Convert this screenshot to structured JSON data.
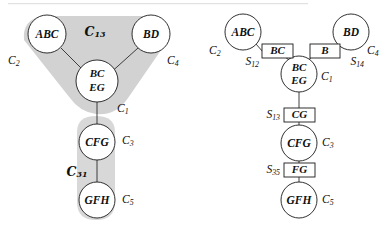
{
  "figure": {
    "caption_top_rule": "",
    "panels": [
      {
        "id": "left",
        "name": "shaded-hypergraph-panel",
        "cluster_labels": [
          {
            "symbol": "C",
            "script": true,
            "sub": "13"
          },
          {
            "symbol": "C",
            "script": true,
            "sub": "31"
          }
        ],
        "nodes": [
          {
            "id": "abc",
            "lines": [
              "ABC"
            ],
            "tag": "C",
            "tag_sub": "2"
          },
          {
            "id": "bd",
            "lines": [
              "BD"
            ],
            "tag": "C",
            "tag_sub": "4"
          },
          {
            "id": "bceg",
            "lines": [
              "BC",
              "EG"
            ],
            "tag": "C",
            "tag_sub": "1"
          },
          {
            "id": "cfg",
            "lines": [
              "CFG"
            ],
            "tag": "C",
            "tag_sub": "3"
          },
          {
            "id": "gfh",
            "lines": [
              "GFH"
            ],
            "tag": "C",
            "tag_sub": "5"
          }
        ]
      },
      {
        "id": "right",
        "name": "junction-tree-panel",
        "nodes": [
          {
            "id": "abc",
            "lines": [
              "ABC"
            ],
            "tag": "C",
            "tag_sub": "2"
          },
          {
            "id": "bd",
            "lines": [
              "BD"
            ],
            "tag": "C",
            "tag_sub": "4"
          },
          {
            "id": "bceg",
            "lines": [
              "BC",
              "EG"
            ],
            "tag": "C",
            "tag_sub": "1"
          },
          {
            "id": "cfg",
            "lines": [
              "CFG"
            ],
            "tag": "C",
            "tag_sub": "3"
          },
          {
            "id": "gfh",
            "lines": [
              "GFH"
            ],
            "tag": "C",
            "tag_sub": "5"
          }
        ],
        "separators": [
          {
            "id": "s12",
            "label": "BC",
            "tag": "S",
            "tag_sub": "12"
          },
          {
            "id": "s14",
            "label": "B",
            "tag": "S",
            "tag_sub": "14"
          },
          {
            "id": "s13",
            "label": "CG",
            "tag": "S",
            "tag_sub": "13"
          },
          {
            "id": "s35",
            "label": "FG",
            "tag": "S",
            "tag_sub": "35"
          }
        ]
      }
    ]
  },
  "left_panel": {
    "script_c13_symbol": "C",
    "script_c13_sub": "13",
    "script_c31_symbol": "C",
    "script_c31_sub": "31",
    "abc_text": "ABC",
    "bd_text": "BD",
    "bceg_line1": "BC",
    "bceg_line2": "EG",
    "cfg_text": "CFG",
    "gfh_text": "GFH",
    "c2_sym": "C",
    "c2_sub": "2",
    "c4_sym": "C",
    "c4_sub": "4",
    "c1_sym": "C",
    "c1_sub": "1",
    "c3_sym": "C",
    "c3_sub": "3",
    "c5_sym": "C",
    "c5_sub": "5"
  },
  "right_panel": {
    "abc_text": "ABC",
    "bd_text": "BD",
    "bceg_line1": "BC",
    "bceg_line2": "EG",
    "cfg_text": "CFG",
    "gfh_text": "GFH",
    "sep_bc_text": "BC",
    "sep_b_text": "B",
    "sep_cg_text": "CG",
    "sep_fg_text": "FG",
    "c2_sym": "C",
    "c2_sub": "2",
    "c4_sym": "C",
    "c4_sub": "4",
    "c1_sym": "C",
    "c1_sub": "1",
    "c3_sym": "C",
    "c3_sub": "3",
    "c5_sym": "C",
    "c5_sub": "5",
    "s12_sym": "S",
    "s12_sub": "12",
    "s14_sym": "S",
    "s14_sub": "14",
    "s13_sym": "S",
    "s13_sub": "13",
    "s35_sym": "S",
    "s35_sub": "35"
  },
  "colors": {
    "blob_gray": "#d2d2d2",
    "stroke": "#1a1a1a",
    "background": "#ffffff"
  }
}
